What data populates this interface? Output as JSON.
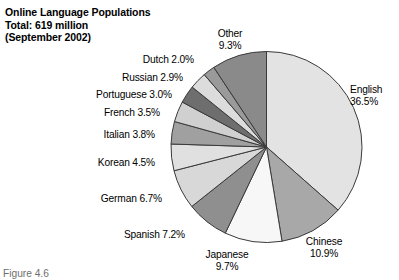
{
  "title": {
    "line1": "Online Language Populations",
    "line2": "Total: 619 million",
    "line3": "(September 2002)"
  },
  "caption": "Figure 4.6",
  "chart_data": {
    "type": "pie",
    "title": "Online Language Populations",
    "subtitle": "Total: 619 million (September 2002)",
    "total_label": "Total: 619 million",
    "date_label": "(September 2002)",
    "unit": "percent",
    "start_angle_deg": 0,
    "direction": "clockwise",
    "grid": false,
    "legend": "none-labels-outside",
    "categories": [
      "English",
      "Chinese",
      "Japanese",
      "Spanish",
      "German",
      "Korean",
      "Italian",
      "French",
      "Portuguese",
      "Russian",
      "Dutch",
      "Other"
    ],
    "values": [
      36.5,
      10.9,
      9.7,
      7.2,
      6.7,
      4.5,
      3.8,
      3.5,
      3.0,
      2.9,
      2.0,
      9.3
    ],
    "colors": [
      "#e3e3e3",
      "#a8a8a8",
      "#f7f7f7",
      "#8f8f8f",
      "#d8d8d8",
      "#e0e0e0",
      "#a0a0a0",
      "#d0d0d0",
      "#6e6e6e",
      "#dcdcdc",
      "#9a9a9a",
      "#8a8a8a"
    ],
    "slices": [
      {
        "name": "English",
        "value": 36.5,
        "label": "English",
        "pct_text": "36.5%",
        "color": "#e3e3e3"
      },
      {
        "name": "Chinese",
        "value": 10.9,
        "label": "Chinese",
        "pct_text": "10.9%",
        "color": "#a8a8a8"
      },
      {
        "name": "Japanese",
        "value": 9.7,
        "label": "Japanese",
        "pct_text": "9.7%",
        "color": "#f7f7f7"
      },
      {
        "name": "Spanish",
        "value": 7.2,
        "label": "Spanish",
        "pct_text": "7.2%",
        "color": "#8f8f8f"
      },
      {
        "name": "German",
        "value": 6.7,
        "label": "German",
        "pct_text": "6.7%",
        "color": "#d8d8d8"
      },
      {
        "name": "Korean",
        "value": 4.5,
        "label": "Korean",
        "pct_text": "4.5%",
        "color": "#e0e0e0"
      },
      {
        "name": "Italian",
        "value": 3.8,
        "label": "Italian",
        "pct_text": "3.8%",
        "color": "#a0a0a0"
      },
      {
        "name": "French",
        "value": 3.5,
        "label": "French",
        "pct_text": "3.5%",
        "color": "#d0d0d0"
      },
      {
        "name": "Portuguese",
        "value": 3.0,
        "label": "Portuguese",
        "pct_text": "3.0%",
        "color": "#6e6e6e"
      },
      {
        "name": "Russian",
        "value": 2.9,
        "label": "Russian",
        "pct_text": "2.9%",
        "color": "#dcdcdc"
      },
      {
        "name": "Dutch",
        "value": 2.0,
        "label": "Dutch",
        "pct_text": "2.0%",
        "color": "#9a9a9a"
      },
      {
        "name": "Other",
        "value": 9.3,
        "label": "Other",
        "pct_text": "9.3%",
        "color": "#8a8a8a"
      }
    ],
    "labels": {
      "other": {
        "name": "Other",
        "pct": "9.3%"
      },
      "english": {
        "name": "English",
        "pct": "36.5%"
      },
      "chinese": {
        "name": "Chinese",
        "pct": "10.9%"
      },
      "japanese": {
        "name": "Japanese",
        "pct": "9.7%"
      },
      "spanish": {
        "name": "Spanish 7.2%"
      },
      "german": {
        "name": "German 6.7%"
      },
      "korean": {
        "name": "Korean 4.5%"
      },
      "italian": {
        "name": "Italian 3.8%"
      },
      "french": {
        "name": "French 3.5%"
      },
      "portuguese": {
        "name": "Portuguese 3.0%"
      },
      "russian": {
        "name": "Russian 2.9%"
      },
      "dutch": {
        "name": "Dutch 2.0%"
      }
    }
  }
}
